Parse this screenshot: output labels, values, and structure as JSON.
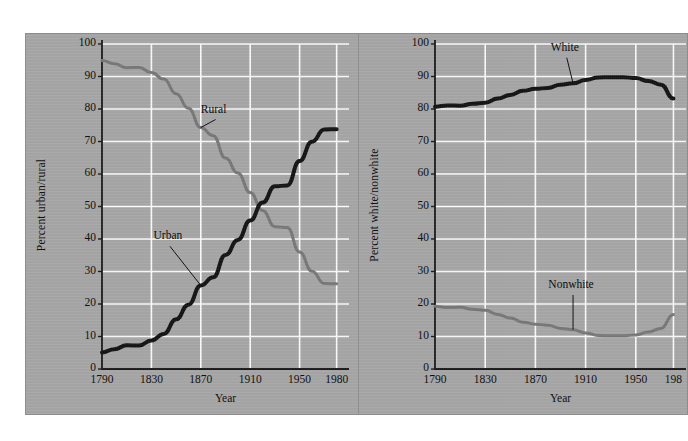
{
  "figure": {
    "background_color": "#ffffff",
    "panel_color": "#a9a9a9",
    "gridline_color": "#ffffff",
    "axis_color": "#1a1a1a"
  },
  "chart_data": [
    {
      "type": "line",
      "id": "urban-rural",
      "title": "",
      "xlabel": "Year",
      "ylabel": "Percent urban/rural",
      "xlim": [
        1790,
        1990
      ],
      "ylim": [
        0,
        100
      ],
      "grid": true,
      "legend_position": "inline-annotation",
      "xticks": [
        1790,
        1830,
        1870,
        1910,
        1950,
        1980
      ],
      "xticklabels": [
        "1790",
        "1830",
        "1870",
        "1910",
        "1950",
        "1980"
      ],
      "yticks": [
        0,
        10,
        20,
        30,
        40,
        50,
        60,
        70,
        80,
        90,
        100
      ],
      "yticklabels": [
        "0",
        "10",
        "20",
        "30",
        "40",
        "50",
        "60",
        "70",
        "80",
        "90",
        "100"
      ],
      "x": [
        1790,
        1800,
        1810,
        1820,
        1830,
        1840,
        1850,
        1860,
        1870,
        1880,
        1890,
        1900,
        1910,
        1920,
        1930,
        1940,
        1950,
        1960,
        1970,
        1980
      ],
      "series": [
        {
          "name": "Rural",
          "color": "#7a7a7a",
          "line_width": 3,
          "values": [
            94.9,
            93.9,
            92.7,
            92.8,
            91.2,
            89.2,
            84.7,
            80.2,
            74.3,
            71.8,
            64.9,
            60.3,
            54.3,
            48.8,
            43.8,
            43.5,
            36.0,
            30.1,
            26.3,
            26.2
          ]
        },
        {
          "name": "Urban",
          "color": "#141414",
          "line_width": 4,
          "values": [
            5.1,
            6.1,
            7.3,
            7.2,
            8.8,
            10.8,
            15.3,
            19.8,
            25.7,
            28.2,
            35.1,
            39.7,
            45.7,
            51.2,
            56.2,
            56.5,
            64.0,
            69.9,
            73.7,
            73.8
          ]
        }
      ],
      "annotations": [
        {
          "label": "Rural",
          "x": 1882,
          "y": 78
        },
        {
          "label": "Urban",
          "x": 1845,
          "y": 39
        }
      ]
    },
    {
      "type": "line",
      "id": "white-nonwhite",
      "title": "",
      "xlabel": "Year",
      "ylabel": "Percent white/nonwhite",
      "xlim": [
        1790,
        1990
      ],
      "ylim": [
        0,
        100
      ],
      "grid": true,
      "legend_position": "inline-annotation",
      "xticks": [
        1790,
        1830,
        1870,
        1910,
        1950,
        1980
      ],
      "xticklabels": [
        "1790",
        "1830",
        "1870",
        "1910",
        "1950",
        "198"
      ],
      "yticks": [
        0,
        10,
        20,
        30,
        40,
        50,
        60,
        70,
        80,
        90,
        100
      ],
      "yticklabels": [
        "0",
        "10",
        "20",
        "30",
        "40",
        "50",
        "60",
        "70",
        "80",
        "90",
        "100"
      ],
      "x": [
        1790,
        1800,
        1810,
        1820,
        1830,
        1840,
        1850,
        1860,
        1870,
        1880,
        1890,
        1900,
        1910,
        1920,
        1930,
        1940,
        1950,
        1960,
        1970,
        1980
      ],
      "series": [
        {
          "name": "White",
          "color": "#141414",
          "line_width": 4,
          "values": [
            80.7,
            81.1,
            81.0,
            81.6,
            81.9,
            83.2,
            84.3,
            85.6,
            86.2,
            86.5,
            87.5,
            87.9,
            88.9,
            89.7,
            89.8,
            89.8,
            89.5,
            88.6,
            87.5,
            83.2
          ]
        },
        {
          "name": "Nonwhite",
          "color": "#7a7a7a",
          "line_width": 3,
          "values": [
            19.3,
            18.9,
            19.0,
            18.4,
            18.1,
            16.8,
            15.7,
            14.4,
            13.8,
            13.5,
            12.5,
            12.1,
            11.1,
            10.3,
            10.2,
            10.2,
            10.5,
            11.4,
            12.5,
            16.8
          ]
        }
      ],
      "annotations": [
        {
          "label": "White",
          "x": 1895,
          "y": 97
        },
        {
          "label": "Nonwhite",
          "x": 1900,
          "y": 24
        }
      ]
    }
  ]
}
